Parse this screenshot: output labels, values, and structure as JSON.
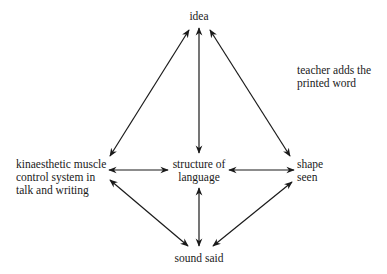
{
  "diagram": {
    "nodes": {
      "idea": {
        "label": "idea"
      },
      "structure": {
        "line1": "structure of",
        "line2": "language"
      },
      "kinaesthetic": {
        "line1": "kinaesthetic muscle",
        "line2": "control system in",
        "line3": "talk and writing"
      },
      "shape": {
        "line1": "shape",
        "line2": "seen"
      },
      "sound": {
        "label": "sound said"
      }
    },
    "annotation": {
      "line1": "teacher adds the",
      "line2": "printed word"
    },
    "edges": [
      {
        "from": "idea",
        "to": "kinaesthetic",
        "type": "bidirectional"
      },
      {
        "from": "idea",
        "to": "structure",
        "type": "bidirectional"
      },
      {
        "from": "idea",
        "to": "shape",
        "type": "bidirectional"
      },
      {
        "from": "kinaesthetic",
        "to": "structure",
        "type": "bidirectional"
      },
      {
        "from": "structure",
        "to": "shape",
        "type": "bidirectional"
      },
      {
        "from": "kinaesthetic",
        "to": "sound",
        "type": "bidirectional"
      },
      {
        "from": "structure",
        "to": "sound",
        "type": "bidirectional"
      },
      {
        "from": "shape",
        "to": "sound",
        "type": "bidirectional"
      }
    ],
    "colors": {
      "line": "#1a1a1a",
      "background": "#ffffff"
    }
  }
}
